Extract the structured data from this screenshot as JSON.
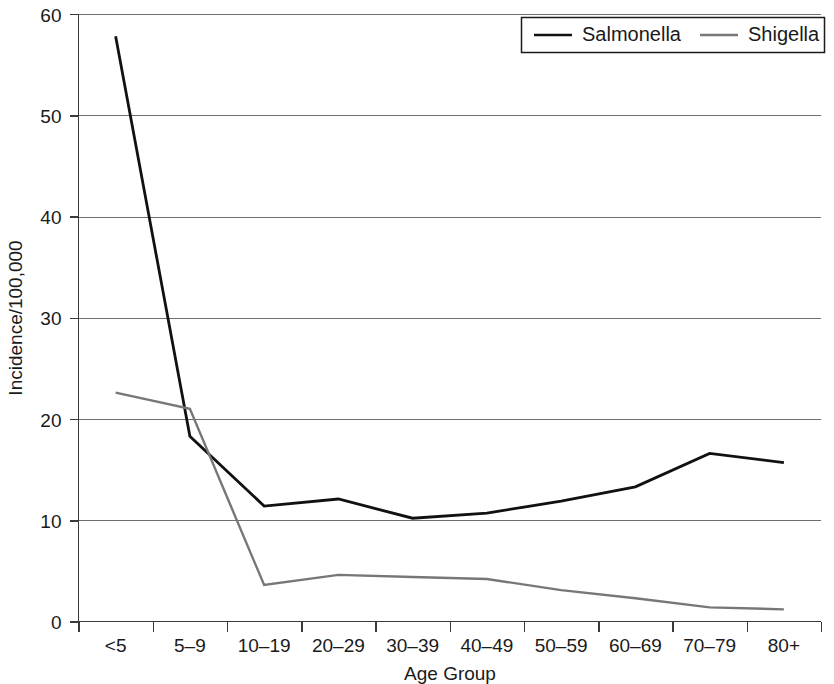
{
  "chart_data": {
    "type": "line",
    "title": "",
    "xlabel": "Age Group",
    "ylabel": "Incidence/100,000",
    "categories": [
      "<5",
      "5–9",
      "10–19",
      "20–29",
      "30–39",
      "40–49",
      "50–59",
      "60–69",
      "70–79",
      "80+"
    ],
    "series": [
      {
        "name": "Salmonella",
        "color": "#111111",
        "values": [
          57.8,
          18.3,
          11.4,
          12.1,
          10.2,
          10.7,
          11.9,
          13.3,
          16.6,
          15.7
        ]
      },
      {
        "name": "Shigella",
        "color": "#777777",
        "values": [
          22.6,
          21.0,
          3.6,
          4.6,
          4.4,
          4.2,
          3.1,
          2.3,
          1.4,
          1.2
        ]
      }
    ],
    "ylim": [
      0,
      60
    ],
    "yticks": [
      0,
      10,
      20,
      30,
      40,
      50,
      60
    ],
    "ytick_labels": [
      "0",
      "10",
      "20",
      "30",
      "40",
      "50",
      "60"
    ],
    "grid": "horizontal",
    "legend_position": "top-right"
  },
  "legend": {
    "entries": [
      {
        "label": "Salmonella",
        "color": "#111111"
      },
      {
        "label": "Shigella",
        "color": "#777777"
      }
    ]
  },
  "axes": {
    "y_title": "Incidence/100,000",
    "x_title": "Age Group"
  }
}
